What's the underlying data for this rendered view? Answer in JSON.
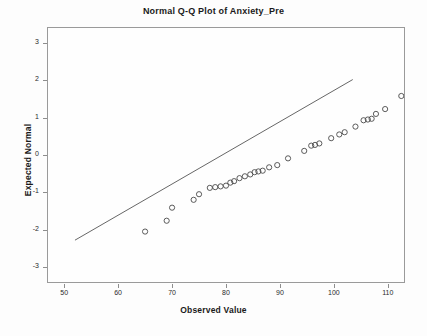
{
  "chart_data": {
    "type": "scatter",
    "title": "Normal Q-Q Plot of Anxiety_Pre",
    "xlabel": "Observed Value",
    "ylabel": "Expected Normal",
    "xlim": [
      47,
      113
    ],
    "ylim": [
      -3.4,
      3.4
    ],
    "grid": false,
    "legend": null,
    "xticks": [
      50,
      60,
      70,
      80,
      90,
      100,
      110
    ],
    "xtick_labels": [
      "50",
      "60",
      "70",
      "80",
      "90",
      "100",
      "110"
    ],
    "yticks": [
      3,
      2,
      1,
      0,
      -1,
      -2,
      -3
    ],
    "ytick_labels": [
      "3",
      "2",
      "1",
      "0",
      "-1",
      "-2",
      "-3"
    ],
    "marker": "open-circle",
    "marker_color": "#4a4a4a",
    "line_color": "#555555",
    "reference_line": {
      "x0": 52.0,
      "y0": -2.28,
      "x1": 103.5,
      "y1": 2.02
    },
    "points": [
      {
        "x": 65.0,
        "y": -2.05
      },
      {
        "x": 69.0,
        "y": -1.76
      },
      {
        "x": 70.0,
        "y": -1.41
      },
      {
        "x": 74.0,
        "y": -1.2
      },
      {
        "x": 75.0,
        "y": -1.05
      },
      {
        "x": 77.0,
        "y": -0.88
      },
      {
        "x": 78.0,
        "y": -0.86
      },
      {
        "x": 79.0,
        "y": -0.84
      },
      {
        "x": 80.0,
        "y": -0.82
      },
      {
        "x": 80.8,
        "y": -0.74
      },
      {
        "x": 81.5,
        "y": -0.7
      },
      {
        "x": 82.5,
        "y": -0.62
      },
      {
        "x": 83.5,
        "y": -0.57
      },
      {
        "x": 84.5,
        "y": -0.52
      },
      {
        "x": 85.3,
        "y": -0.46
      },
      {
        "x": 86.0,
        "y": -0.44
      },
      {
        "x": 86.8,
        "y": -0.42
      },
      {
        "x": 88.0,
        "y": -0.33
      },
      {
        "x": 89.5,
        "y": -0.27
      },
      {
        "x": 91.5,
        "y": -0.09
      },
      {
        "x": 94.5,
        "y": 0.11
      },
      {
        "x": 95.8,
        "y": 0.25
      },
      {
        "x": 96.5,
        "y": 0.27
      },
      {
        "x": 97.3,
        "y": 0.31
      },
      {
        "x": 99.5,
        "y": 0.45
      },
      {
        "x": 101.0,
        "y": 0.55
      },
      {
        "x": 102.0,
        "y": 0.61
      },
      {
        "x": 104.0,
        "y": 0.76
      },
      {
        "x": 105.5,
        "y": 0.93
      },
      {
        "x": 106.3,
        "y": 0.95
      },
      {
        "x": 107.0,
        "y": 0.97
      },
      {
        "x": 107.8,
        "y": 1.1
      },
      {
        "x": 109.5,
        "y": 1.23
      },
      {
        "x": 112.5,
        "y": 1.58
      },
      {
        "x": 115.0,
        "y": 1.9
      }
    ]
  }
}
